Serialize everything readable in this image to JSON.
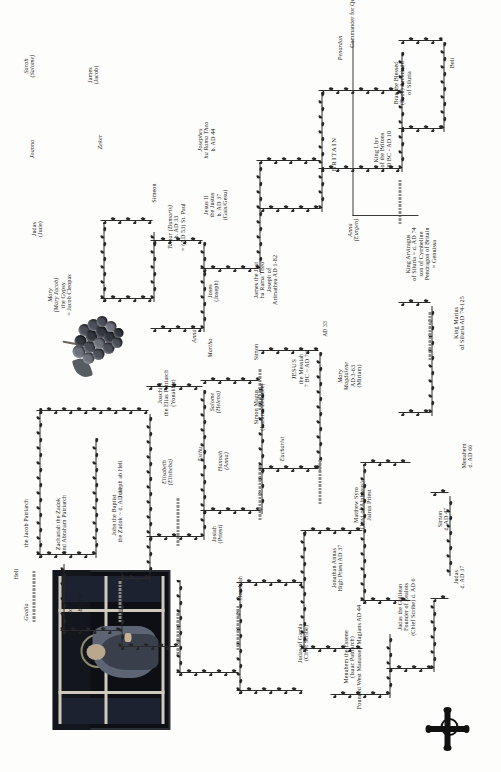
{
  "document": {
    "title": "Desposyni Vine Genealogical Chart",
    "orientation": "landscape-rotated-90ccw"
  },
  "artwork": {
    "window": {
      "name": "stained-glass-window",
      "caption": ""
    },
    "grapes": {
      "name": "grape-cluster-illustration",
      "caption": ""
    },
    "cross": {
      "name": "celtic-cross-icon",
      "caption": ""
    }
  },
  "section_labels": {
    "britain": "BRITAIN"
  },
  "nodes": [
    {
      "id": "heli",
      "lines": [
        "Heli"
      ]
    },
    {
      "id": "gaalia",
      "lines": [
        "Gaalia"
      ],
      "italic": [
        0
      ]
    },
    {
      "id": "jacob-patriarch",
      "lines": [
        "the Jacob Patriarch"
      ]
    },
    {
      "id": "matthat-zadok",
      "lines": [
        "Matthat Zadok"
      ]
    },
    {
      "id": "sahorra",
      "lines": [
        "= Sahorra (Sobrieth)"
      ],
      "italic": [
        0
      ]
    },
    {
      "id": "zachariah",
      "lines": [
        "Zachariah the Zadok",
        "and Abraham Patriarch"
      ]
    },
    {
      "id": "john-baptist",
      "lines": [
        "John the Baptist",
        "the Zadok ~ d. AD 31"
      ]
    },
    {
      "id": "sarah-salome",
      "lines": [
        "Sarah",
        "(Salome)"
      ],
      "italic": [
        0,
        1
      ]
    },
    {
      "id": "joanna",
      "lines": [
        "Joanna"
      ],
      "italic": [
        0
      ]
    },
    {
      "id": "james-jacob",
      "lines": [
        "James",
        "(Jacob)"
      ]
    },
    {
      "id": "zeker",
      "lines": [
        "Zeker"
      ]
    },
    {
      "id": "judas-jude",
      "lines": [
        "Judas",
        "(Jude)"
      ]
    },
    {
      "id": "simeon",
      "lines": [
        "Simeon"
      ]
    },
    {
      "id": "mary-gypsy",
      "lines": [
        "Mary",
        "(Mary Jacob)",
        "the Gypsy",
        "= Jacob Cleopas"
      ],
      "italic": [
        0,
        1
      ]
    },
    {
      "id": "elisabeth",
      "lines": [
        "Elisabeth",
        "(Elisheba)"
      ],
      "italic": [
        0,
        1
      ]
    },
    {
      "id": "joachim",
      "lines": [
        "Joachim",
        "the Elias Patriarch",
        "(Yonakhir)"
      ]
    },
    {
      "id": "hannah",
      "lines": [
        "Hannah",
        "(Anna)"
      ],
      "italic": [
        0,
        1
      ]
    },
    {
      "id": "joseph-ab-heli",
      "lines": [
        "Joseph ab Heli"
      ]
    },
    {
      "id": "josiah",
      "lines": [
        "Josiah",
        "(Priest)"
      ]
    },
    {
      "id": "esthu",
      "lines": [
        "Esthu"
      ],
      "italic": [
        0
      ]
    },
    {
      "id": "hezekiah",
      "lines": [
        "Hezekiah"
      ]
    },
    {
      "id": "judas-gamla",
      "lines": [
        "Judas of Gamla",
        "(Chief Scribe)"
      ]
    },
    {
      "id": "menahem-essene",
      "lines": [
        "Menahem the Essene",
        "(Isaac Patriarch)",
        "Founded West Manasseh Magians AD 44"
      ]
    },
    {
      "id": "judas-galilean",
      "lines": [
        "Judas the Galilean",
        "Founder of Zealots",
        "(Chief Scribe) d. AD 6"
      ]
    },
    {
      "id": "judas-d37",
      "lines": [
        "Judas",
        "d. AD 37"
      ]
    },
    {
      "id": "simon-d47",
      "lines": [
        "Simon",
        "d. AD 47"
      ]
    },
    {
      "id": "menahem-d66",
      "lines": [
        "Menahem",
        "d. AD 66"
      ]
    },
    {
      "id": "jonathan-annas",
      "lines": [
        "Jonathan Annas",
        "High Priest AD 37"
      ]
    },
    {
      "id": "matthew-syro",
      "lines": [
        "Matthew Syro",
        "(Levi of Alphaeus)",
        "Jairus Priest"
      ]
    },
    {
      "id": "simon-magus",
      "lines": [
        "Simon Magus",
        "(Lazarus/Zebedee)"
      ]
    },
    {
      "id": "eucharist",
      "lines": [
        "Eucharist"
      ],
      "italic": [
        0
      ]
    },
    {
      "id": "martha",
      "lines": [
        "Martha"
      ],
      "italic": [
        0
      ]
    },
    {
      "id": "salome-helena",
      "lines": [
        "Salome",
        "(Helena)"
      ],
      "italic": [
        0,
        1
      ]
    },
    {
      "id": "simon",
      "lines": [
        "Simon"
      ]
    },
    {
      "id": "joses-joseph",
      "lines": [
        "Joses",
        "(Joseph)"
      ]
    },
    {
      "id": "jesus",
      "lines": [
        "JESUS",
        "the Messiah",
        "7 BC ~ AD 73"
      ]
    },
    {
      "id": "mary-magdalene",
      "lines": [
        "Mary",
        "Magdalene",
        "AD 3-63",
        "(Miriam)"
      ],
      "italic": [
        0,
        1
      ]
    },
    {
      "id": "ad33-a",
      "lines": [
        "AD 33"
      ]
    },
    {
      "id": "james-just",
      "lines": [
        "James the Just",
        "ha Rama Theo",
        "Joseph of",
        "Arimathea AD 1-82"
      ]
    },
    {
      "id": "anna-1",
      "lines": [
        "Anna"
      ],
      "italic": [
        0
      ]
    },
    {
      "id": "anna-2",
      "lines": [
        "Anna",
        "(Eurgen)"
      ],
      "italic": [
        0,
        1
      ]
    },
    {
      "id": "tamar",
      "lines": [
        "Tamar (Damaris)",
        "b. AD 33",
        "= (AD 53) St. Paul"
      ],
      "italic": [
        0
      ]
    },
    {
      "id": "jesus-ii",
      "lines": [
        "Jesus II",
        "the Justus",
        "b. AD 37",
        "(Gais/Gesu)"
      ]
    },
    {
      "id": "josephes",
      "lines": [
        "Josephes",
        "ha Rama Theo",
        "b. AD 44"
      ],
      "italic": [
        0,
        1
      ]
    },
    {
      "id": "king-llyr",
      "lines": [
        "King Llyr",
        "of the Britons",
        "20 BC - AD 10"
      ]
    },
    {
      "id": "bran",
      "lines": [
        "Bran the Blessed",
        "(Bron) Archdruid",
        "of Siluria"
      ]
    },
    {
      "id": "beli",
      "lines": [
        "Beli"
      ]
    },
    {
      "id": "penardun",
      "lines": [
        "Penardun"
      ],
      "italic": [
        0
      ]
    },
    {
      "id": "commander",
      "lines": [
        "Commander for Queen Boudicca"
      ]
    },
    {
      "id": "king-arviragus",
      "lines": [
        "King Arviragus",
        "of Siluria ~ d. AD 74",
        "son of Cymbeline",
        "Pendragon of Britain",
        "= Genuissa"
      ]
    },
    {
      "id": "king-marius",
      "lines": [
        "King Marius",
        "of Siluria AD 74-125"
      ]
    }
  ],
  "colors": {
    "ink": "#1a1a1a",
    "vine": "#262626",
    "bead": "#8d8d8d",
    "paper": "#fdfdfc"
  }
}
